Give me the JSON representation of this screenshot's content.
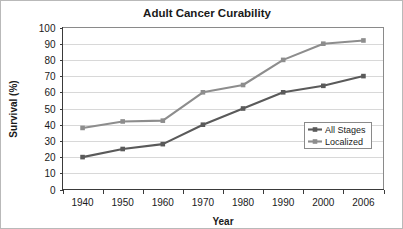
{
  "chart_data": {
    "type": "line",
    "title": "Adult Cancer Curability",
    "xlabel": "Year",
    "ylabel": "Survival (%)",
    "categories": [
      "1940",
      "1950",
      "1960",
      "1970",
      "1980",
      "1990",
      "2000",
      "2006"
    ],
    "x": [
      1940,
      1950,
      1960,
      1970,
      1980,
      1990,
      2000,
      2006
    ],
    "series": [
      {
        "name": "All Stages",
        "color": "#5a5a5a",
        "marker": "square",
        "values": [
          20,
          25,
          28,
          40,
          50,
          60,
          64,
          70
        ]
      },
      {
        "name": "Localized",
        "color": "#8d8d8d",
        "marker": "square",
        "values": [
          38,
          42,
          42.5,
          60,
          64.5,
          80,
          90,
          92
        ]
      }
    ],
    "ylim": [
      0,
      100
    ],
    "ytick_step": 10,
    "yticks": [
      "0",
      "10",
      "20",
      "30",
      "40",
      "50",
      "60",
      "70",
      "80",
      "90",
      "100"
    ],
    "grid": "horizontal",
    "legend_position": "middle-right"
  },
  "legend": {
    "entries": [
      {
        "label": "All Stages"
      },
      {
        "label": "Localized"
      }
    ]
  },
  "axes": {
    "y_title": "Survival (%)",
    "x_title": "Year"
  },
  "title": {
    "text": "Adult Cancer Curability"
  },
  "colors": {
    "all_stages": "#5a5a5a",
    "localized": "#8d8d8d",
    "gridline": "#d8d8d8",
    "frame": "#8a8a8a",
    "text": "#1a1a1a"
  }
}
